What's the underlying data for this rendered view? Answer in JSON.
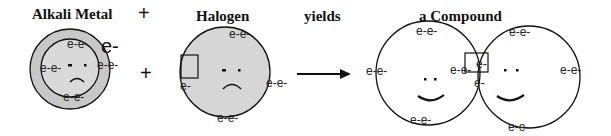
{
  "labels": {
    "alkali_title": "Alkali Metal",
    "plus_top": "+",
    "plus_mid": "+",
    "halogen_title": "Halogen",
    "yields": "yields",
    "compound_title": "a Compound"
  },
  "alkali": {
    "lone_electron": "e-",
    "inner_top": "e-e-",
    "inner_left": "e-e-",
    "inner_right": "e-e-",
    "inner_bottom": "e-e-"
  },
  "halogen": {
    "top": "e-e-",
    "right": "e-e-",
    "bottom": "e-e-",
    "left_single": "e-"
  },
  "compound": {
    "left_top": "e-e-",
    "left_left": "e-e-",
    "left_bottom": "e-e-",
    "shared_pair": "e-e-",
    "right_top": "e-e-",
    "right_right": "e-e-",
    "right_bottom": "e-e-",
    "right_below_box": "e-"
  },
  "colors": {
    "outer_fill": "#c8c8c8",
    "inner_fill": "#d9d9d9",
    "halogen_fill": "#d6d6d6",
    "stroke": "#111111"
  }
}
